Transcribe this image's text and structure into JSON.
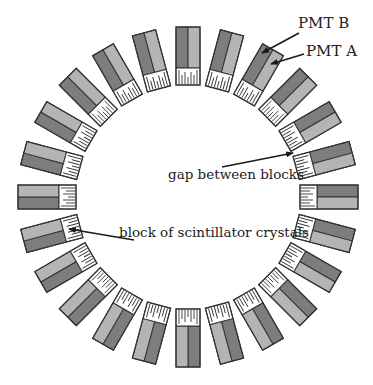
{
  "figure": {
    "ring": {
      "block_count": 24,
      "center": [
        188,
        197
      ],
      "outer_radius": 170,
      "block_width": 24,
      "pmt_length": 41,
      "crystal_length": 17,
      "crystal_ticks": [
        14,
        9,
        12,
        7,
        12,
        9,
        14
      ],
      "colors": {
        "pmt_b": "#7d7d7d",
        "pmt_a": "#b4b4b4",
        "crystal": "#ffffff",
        "outline": "#333333",
        "tick": "#333333",
        "arrow": "#1a1a1a"
      }
    },
    "annotations": [
      {
        "id": "pmt-b",
        "label": "PMT B",
        "text_x": 298,
        "text_y": 28,
        "anchor": "start",
        "from": [
          299,
          33
        ],
        "to": [
          262,
          53
        ]
      },
      {
        "id": "pmt-a",
        "label": "PMT A",
        "text_x": 306,
        "text_y": 56,
        "anchor": "start",
        "from": [
          304,
          54
        ],
        "to": [
          271,
          64
        ]
      },
      {
        "id": "gap",
        "label": "gap between blocks",
        "text_x": 168,
        "text_y": 179,
        "anchor": "start",
        "from": [
          222,
          167
        ],
        "to": [
          293,
          153
        ]
      },
      {
        "id": "crystals",
        "label": "block of scintillator crystals",
        "text_x": 119,
        "text_y": 237,
        "anchor": "start",
        "from": [
          134,
          240
        ],
        "to": [
          69,
          229
        ]
      }
    ]
  }
}
